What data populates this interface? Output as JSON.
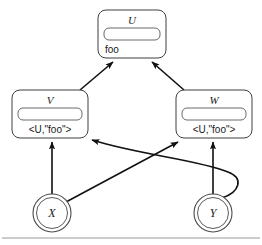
{
  "diagram": {
    "type": "object-reference-graph",
    "nodes": [
      {
        "id": "U",
        "kind": "object-box",
        "title": "U",
        "slot_value": "",
        "field_value": "foo",
        "x": 98,
        "y": 10,
        "width": 68,
        "height": 48
      },
      {
        "id": "V",
        "kind": "object-box",
        "title": "V",
        "slot_value": "",
        "field_value": "<U,\"foo\">",
        "x": 12,
        "y": 90,
        "width": 76,
        "height": 48
      },
      {
        "id": "W",
        "kind": "object-box",
        "title": "W",
        "slot_value": "",
        "field_value": "<U,\"foo\">",
        "x": 176,
        "y": 90,
        "width": 76,
        "height": 48
      },
      {
        "id": "X",
        "kind": "double-circle",
        "label": "X",
        "cx": 52,
        "cy": 213,
        "r_outer": 19,
        "r_inner": 15.5
      },
      {
        "id": "Y",
        "kind": "double-circle",
        "label": "Y",
        "cx": 213,
        "cy": 213,
        "r_outer": 19,
        "r_inner": 15.5
      }
    ],
    "edges": [
      {
        "id": "V-to-U",
        "from": "V",
        "to": "U",
        "style": "straight",
        "arrow": true
      },
      {
        "id": "W-to-U",
        "from": "W",
        "to": "U",
        "style": "straight",
        "arrow": true
      },
      {
        "id": "X-to-V",
        "from": "X",
        "to": "V",
        "style": "straight",
        "arrow": true
      },
      {
        "id": "Y-to-W",
        "from": "Y",
        "to": "W",
        "style": "straight",
        "arrow": true
      },
      {
        "id": "X-to-W",
        "from": "X",
        "to": "W",
        "style": "straight",
        "arrow": true
      },
      {
        "id": "Y-to-V",
        "from": "Y",
        "to": "V",
        "style": "curved",
        "arrow": true
      }
    ],
    "colors": {
      "background": "#ffffff",
      "box_stroke": "#3f3f3f",
      "inner_stroke": "#6a6a6a",
      "edge_stroke": "#111111",
      "circle_stroke": "#4a4a4a",
      "rule_stroke": "#9a9a9a",
      "text": "#1a1a1a"
    }
  }
}
